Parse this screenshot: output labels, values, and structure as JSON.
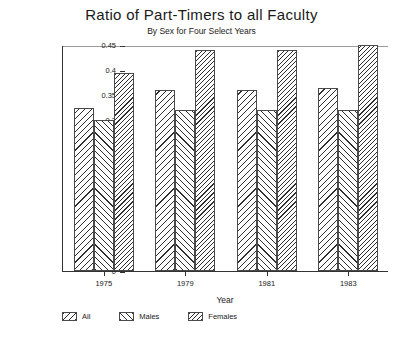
{
  "chart_data": {
    "type": "bar",
    "title": "Ratio of Part-Timers to all Faculty",
    "subtitle": "By Sex for Four Select Years",
    "xlabel": "Year",
    "ylabel": "Ratio of Part-Time to Total",
    "categories": [
      "1975",
      "1979",
      "1981",
      "1983"
    ],
    "series": [
      {
        "name": "All",
        "values": [
          0.325,
          0.36,
          0.36,
          0.365
        ]
      },
      {
        "name": "Males",
        "values": [
          0.3,
          0.32,
          0.32,
          0.32
        ]
      },
      {
        "name": "Females",
        "values": [
          0.395,
          0.44,
          0.44,
          0.45
        ]
      }
    ],
    "ylim": [
      0,
      0.45
    ],
    "yticks": [
      "0",
      "0.05",
      "0.1",
      "0.15",
      "0.2",
      "0.25",
      "0.3",
      "0.35",
      "0.4",
      "0.45"
    ],
    "ytick_values": [
      0,
      0.05,
      0.1,
      0.15,
      0.2,
      0.25,
      0.3,
      0.35,
      0.4,
      0.45
    ],
    "grid": false,
    "legend_position": "bottom-left",
    "patterns": [
      "hatch-back",
      "hatch-fwd",
      "hatch-dense"
    ]
  }
}
